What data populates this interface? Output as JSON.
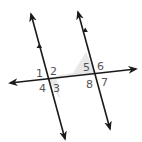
{
  "diagram": {
    "colors": {
      "line": "#1a1a1a",
      "label": "#555555",
      "shade": "#e3e3e3"
    },
    "labels": [
      {
        "id": "1",
        "text": "1",
        "x": 37,
        "y": 76
      },
      {
        "id": "2",
        "text": "2",
        "x": 51,
        "y": 74
      },
      {
        "id": "3",
        "text": "3",
        "x": 53,
        "y": 91
      },
      {
        "id": "4",
        "text": "4",
        "x": 39,
        "y": 91
      },
      {
        "id": "5",
        "text": "5",
        "x": 84,
        "y": 71
      },
      {
        "id": "6",
        "text": "6",
        "x": 97,
        "y": 69
      },
      {
        "id": "7",
        "text": "7",
        "x": 101,
        "y": 85
      },
      {
        "id": "8",
        "text": "8",
        "x": 86,
        "y": 87
      }
    ]
  }
}
